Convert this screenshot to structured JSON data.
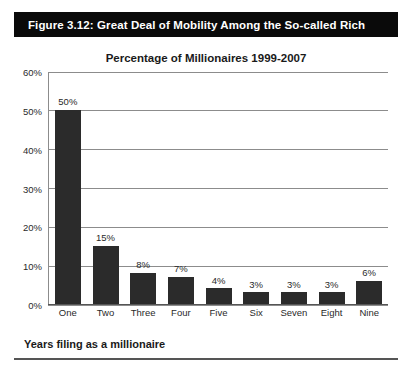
{
  "figure": {
    "banner_label": "Figure 3.12:  Great Deal of Mobility Among the So-called Rich",
    "banner_color": "#0a0a0a",
    "caption": "Years filing as a millionaire"
  },
  "chart_data": {
    "type": "bar",
    "title": "Percentage of Millionaires 1999-2007",
    "xlabel": "Years filing as a millionaire",
    "ylabel": "",
    "categories": [
      "One",
      "Two",
      "Three",
      "Four",
      "Five",
      "Six",
      "Seven",
      "Eight",
      "Nine"
    ],
    "values": [
      50,
      15,
      8,
      7,
      4,
      3,
      3,
      3,
      6
    ],
    "value_labels": [
      "50%",
      "15%",
      "8%",
      "7%",
      "4%",
      "3%",
      "3%",
      "3%",
      "6%"
    ],
    "ylim": [
      0,
      60
    ],
    "yticks": [
      0,
      10,
      20,
      30,
      40,
      50,
      60
    ],
    "ytick_labels": [
      "0%",
      "10%",
      "20%",
      "30%",
      "40%",
      "50%",
      "60%"
    ],
    "grid": true,
    "legend": null,
    "bar_color": "#2b2b2b",
    "grid_color": "#8c8c8c"
  }
}
